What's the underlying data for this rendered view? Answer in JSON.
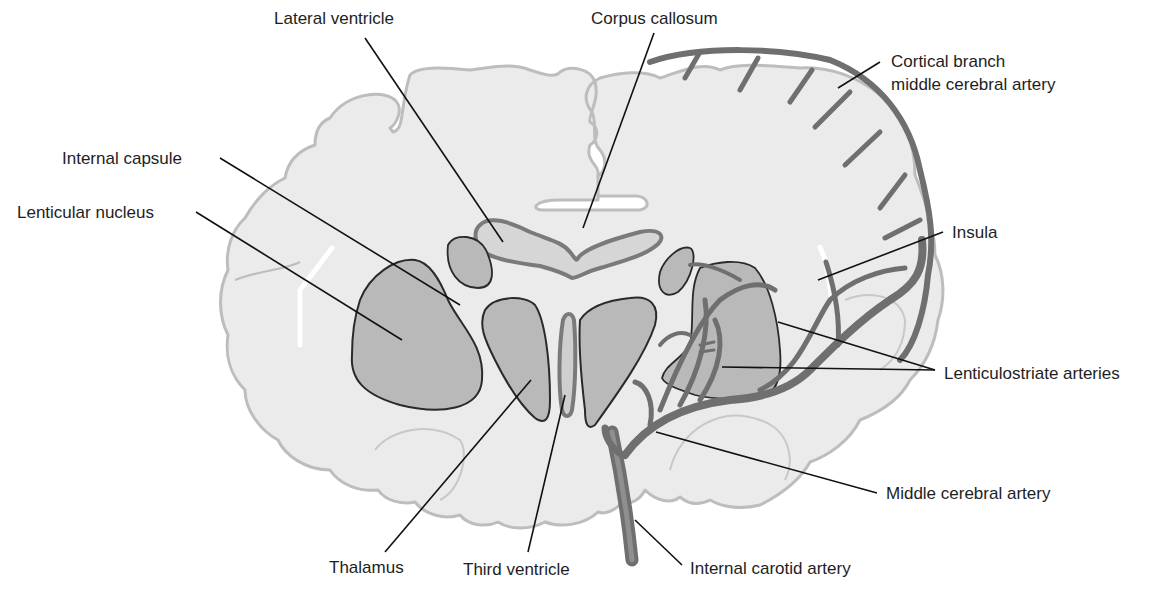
{
  "diagram": {
    "colors": {
      "background": "#ffffff",
      "brain_fill": "#ebebeb",
      "brain_outline": "#bdbdbd",
      "nucleus_fill": "#b9b9b9",
      "nucleus_outline": "#2a2a2a",
      "ventricle_fill": "#d6d6d6",
      "ventricle_edge": "#7a7a7a",
      "artery": "#6f6f6f",
      "leader_line": "#111111",
      "label_text": "#1e1e1e"
    },
    "labels": {
      "lateral_ventricle": "Lateral ventricle",
      "corpus_callosum": "Corpus callosum",
      "cortical_branch_line1": "Cortical branch",
      "cortical_branch_line2": "middle cerebral artery",
      "internal_capsule": "Internal capsule",
      "lenticular_nucleus": "Lenticular nucleus",
      "insula": "Insula",
      "lenticulostriate_arteries": "Lenticulostriate arteries",
      "middle_cerebral_artery": "Middle cerebral artery",
      "thalamus": "Thalamus",
      "third_ventricle": "Third ventricle",
      "internal_carotid_artery": "Internal carotid artery"
    }
  }
}
